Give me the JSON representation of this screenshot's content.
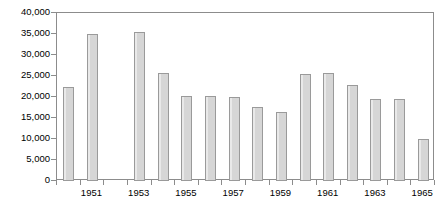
{
  "chart_data": {
    "type": "bar",
    "title": "",
    "subtitle": "",
    "xlabel": "",
    "ylabel": "",
    "categories": [
      "1950",
      "1951",
      "1952",
      "1953",
      "1954",
      "1955",
      "1956",
      "1957",
      "1958",
      "1959",
      "1960",
      "1961",
      "1962",
      "1963",
      "1964",
      "1965"
    ],
    "values": [
      22500,
      35000,
      0,
      35500,
      25800,
      20200,
      20300,
      20100,
      17600,
      16500,
      25500,
      25600,
      22800,
      19600,
      19600,
      9900
    ],
    "ylim": [
      0,
      40000
    ],
    "ytick_labels": [
      "0",
      "5,000",
      "10,000",
      "15,000",
      "20,000",
      "25,000",
      "30,000",
      "35,000",
      "40,000"
    ],
    "ytick_values": [
      0,
      5000,
      10000,
      15000,
      20000,
      25000,
      30000,
      35000,
      40000
    ],
    "xtick_labels": [
      "1951",
      "1953",
      "1955",
      "1957",
      "1959",
      "1961",
      "1963",
      "1965"
    ],
    "grid": false,
    "legend": null,
    "bar_color": "#d6d6d6",
    "bar_border_color": "#9a9a9a",
    "axis_color": "#8c8c8c",
    "text_color": "#000000",
    "background": "#ffffff"
  }
}
